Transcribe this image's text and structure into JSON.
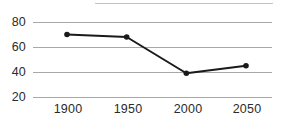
{
  "chart_data": {
    "type": "line",
    "title": "",
    "subtitle": "",
    "xlabel": "",
    "ylabel": "",
    "categories": [
      "1900",
      "1950",
      "2000",
      "2050"
    ],
    "x": [
      1900,
      1950,
      2000,
      2050
    ],
    "values": [
      70,
      68,
      39,
      45
    ],
    "series": [
      {
        "name": "series-1",
        "values": [
          70,
          68,
          39,
          45
        ],
        "color": "#1a1a1a",
        "marker": "circle",
        "line_width": 2
      }
    ],
    "ylim": [
      20,
      80
    ],
    "xlim": [
      1900,
      2050
    ],
    "y_ticks": [
      20,
      40,
      60,
      80
    ],
    "y_tick_labels": [
      "20",
      "40",
      "60",
      "80"
    ],
    "x_ticks": [
      1900,
      1950,
      2000,
      2050
    ],
    "x_tick_labels": [
      "1900",
      "1950",
      "2000",
      "2050"
    ],
    "grid": true,
    "grid_axis": "y",
    "grid_color": "#a8a8a8",
    "legend": false,
    "legend_position": "none",
    "annotations": [],
    "background_color": "#ffffff",
    "text_color": "#2b2b2b"
  },
  "axes": {
    "y_labels": [
      "80",
      "60",
      "40",
      "20"
    ],
    "x_labels": [
      "1900",
      "1950",
      "2000",
      "2050"
    ]
  },
  "points": [
    {
      "label": "1900",
      "value": "70"
    },
    {
      "label": "1950",
      "value": "68"
    },
    {
      "label": "2000",
      "value": "39"
    },
    {
      "label": "2050",
      "value": "45"
    }
  ]
}
